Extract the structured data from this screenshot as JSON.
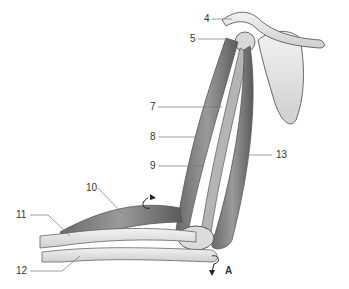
{
  "figure": {
    "labels": [
      {
        "id": "4",
        "text": "4",
        "x": 204,
        "y": 14
      },
      {
        "id": "5",
        "text": "5",
        "x": 190,
        "y": 34
      },
      {
        "id": "7",
        "text": "7",
        "x": 150,
        "y": 102
      },
      {
        "id": "8",
        "text": "8",
        "x": 150,
        "y": 132
      },
      {
        "id": "9",
        "text": "9",
        "x": 150,
        "y": 161
      },
      {
        "id": "10",
        "text": "10",
        "x": 86,
        "y": 183
      },
      {
        "id": "11",
        "text": "11",
        "x": 16,
        "y": 210
      },
      {
        "id": "12",
        "text": "12",
        "x": 16,
        "y": 266
      },
      {
        "id": "13",
        "text": "13",
        "x": 276,
        "y": 150
      },
      {
        "id": "A",
        "text": "A",
        "x": 225,
        "y": 266
      }
    ],
    "colors": {
      "muscle": "#8c8c8c",
      "muscle_dark": "#5e5e5e",
      "bone": "#e2e2e2",
      "outline": "#6a6a6a",
      "label_line": "#777777"
    }
  }
}
